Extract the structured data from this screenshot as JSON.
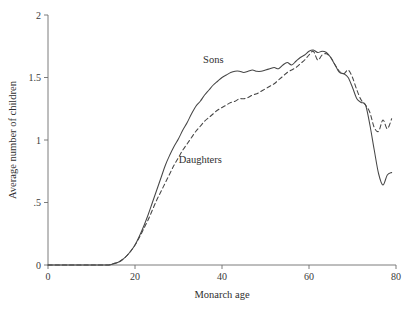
{
  "chart_data": {
    "type": "line",
    "title": "",
    "xlabel": "Monarch age",
    "ylabel": "Average number of children",
    "xlim": [
      0,
      80
    ],
    "ylim": [
      0,
      2
    ],
    "xticks": [
      0,
      20,
      40,
      60,
      80
    ],
    "xtick_labels": [
      "0",
      "20",
      "40",
      "60",
      "80"
    ],
    "yticks": [
      0,
      0.5,
      1,
      1.5,
      2
    ],
    "ytick_labels": [
      "0",
      ".5",
      "1",
      "1.5",
      "2"
    ],
    "grid": false,
    "legend_position": "inline-annotation",
    "annotations": [
      {
        "text": "Sons",
        "x": 38,
        "y": 1.62
      },
      {
        "text": "Daughters",
        "x": 35,
        "y": 0.82
      }
    ],
    "series": [
      {
        "name": "Sons",
        "style": "solid",
        "color": "#464646",
        "x": [
          0,
          2,
          4,
          6,
          8,
          10,
          12,
          14,
          15,
          16,
          17,
          18,
          19,
          20,
          21,
          22,
          23,
          24,
          25,
          26,
          27,
          28,
          29,
          30,
          31,
          32,
          33,
          34,
          35,
          36,
          37,
          38,
          39,
          40,
          41,
          42,
          43,
          44,
          45,
          46,
          47,
          48,
          49,
          50,
          51,
          52,
          53,
          54,
          55,
          56,
          57,
          58,
          59,
          60,
          61,
          62,
          63,
          64,
          65,
          66,
          67,
          68,
          69,
          70,
          71,
          72,
          73,
          74,
          75,
          76,
          77,
          78,
          79
        ],
        "values": [
          0.0,
          0.0,
          0.0,
          0.0,
          0.0,
          0.0,
          0.0,
          0.0,
          0.01,
          0.02,
          0.04,
          0.07,
          0.11,
          0.16,
          0.23,
          0.31,
          0.4,
          0.5,
          0.6,
          0.7,
          0.8,
          0.88,
          0.95,
          1.01,
          1.08,
          1.14,
          1.21,
          1.27,
          1.31,
          1.36,
          1.4,
          1.44,
          1.47,
          1.5,
          1.52,
          1.54,
          1.55,
          1.55,
          1.54,
          1.55,
          1.56,
          1.55,
          1.55,
          1.56,
          1.57,
          1.58,
          1.57,
          1.6,
          1.62,
          1.6,
          1.63,
          1.66,
          1.68,
          1.71,
          1.72,
          1.7,
          1.71,
          1.7,
          1.66,
          1.6,
          1.54,
          1.53,
          1.5,
          1.42,
          1.33,
          1.3,
          1.28,
          1.12,
          0.92,
          0.73,
          0.64,
          0.72,
          0.74
        ]
      },
      {
        "name": "Daughters",
        "style": "dashed",
        "color": "#464646",
        "x": [
          0,
          2,
          4,
          6,
          8,
          10,
          12,
          14,
          15,
          16,
          17,
          18,
          19,
          20,
          21,
          22,
          23,
          24,
          25,
          26,
          27,
          28,
          29,
          30,
          31,
          32,
          33,
          34,
          35,
          36,
          37,
          38,
          39,
          40,
          41,
          42,
          43,
          44,
          45,
          46,
          47,
          48,
          49,
          50,
          51,
          52,
          53,
          54,
          55,
          56,
          57,
          58,
          59,
          60,
          61,
          62,
          63,
          64,
          65,
          66,
          67,
          68,
          69,
          70,
          71,
          72,
          73,
          74,
          75,
          76,
          77,
          78,
          79
        ],
        "values": [
          0.0,
          0.0,
          0.0,
          0.0,
          0.0,
          0.0,
          0.0,
          0.0,
          0.01,
          0.02,
          0.04,
          0.07,
          0.11,
          0.16,
          0.22,
          0.29,
          0.36,
          0.44,
          0.52,
          0.59,
          0.66,
          0.73,
          0.8,
          0.86,
          0.92,
          0.97,
          1.02,
          1.07,
          1.11,
          1.15,
          1.18,
          1.21,
          1.24,
          1.26,
          1.28,
          1.3,
          1.31,
          1.33,
          1.33,
          1.34,
          1.36,
          1.37,
          1.39,
          1.41,
          1.43,
          1.45,
          1.48,
          1.51,
          1.54,
          1.56,
          1.58,
          1.61,
          1.64,
          1.68,
          1.71,
          1.64,
          1.68,
          1.69,
          1.66,
          1.6,
          1.55,
          1.53,
          1.56,
          1.5,
          1.4,
          1.32,
          1.28,
          1.22,
          1.1,
          1.07,
          1.16,
          1.09,
          1.17
        ]
      }
    ]
  },
  "layout": {
    "plot_left": 48,
    "plot_right": 396,
    "plot_top": 15,
    "plot_bottom": 265
  }
}
